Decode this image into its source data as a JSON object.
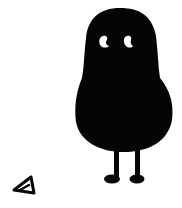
{
  "illustration": {
    "subject": "black blob creature with two eyes, two thin legs and feet",
    "secondary": "small outlined triangle doodle",
    "colors": {
      "background": "#ffffff",
      "ink": "#050505",
      "eye": "#ffffff"
    },
    "icons": {
      "creature": "blob-creature-icon",
      "triangle": "triangle-icon"
    }
  }
}
